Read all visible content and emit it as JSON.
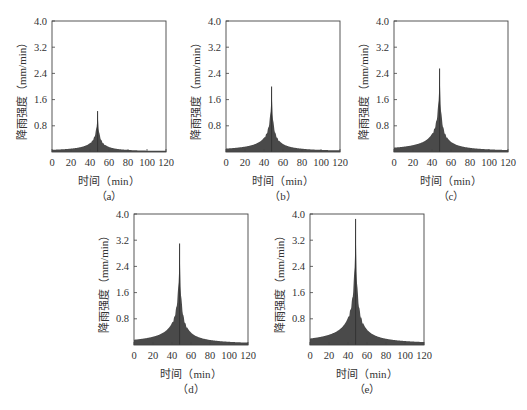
{
  "figure": {
    "ylabel": "降雨强度（mm/min）",
    "xlabel": "时间（min）"
  },
  "chart_data": [
    {
      "type": "area",
      "caption": "（a）",
      "title": "",
      "xlabel": "时间（min）",
      "ylabel": "降雨强度（mm/min）",
      "xlim": [
        0,
        120
      ],
      "ylim": [
        0,
        4.0
      ],
      "xticks": [
        0,
        20,
        40,
        60,
        80,
        100,
        120
      ],
      "yticks": [
        0.8,
        1.6,
        2.4,
        3.2,
        4.0
      ],
      "ytick_labels": [
        "0.8",
        "1.6",
        "2.4",
        "3.2",
        "4.0"
      ],
      "peak_time": 48,
      "peak_value": 1.25,
      "start_value": 0.05,
      "end_value": 0.04,
      "x": [
        0,
        10,
        20,
        30,
        40,
        44,
        46,
        48,
        50,
        52,
        56,
        60,
        70,
        80,
        90,
        100,
        110,
        120
      ],
      "values": [
        0.05,
        0.08,
        0.12,
        0.2,
        0.38,
        0.55,
        0.75,
        1.25,
        0.8,
        0.6,
        0.42,
        0.32,
        0.2,
        0.13,
        0.09,
        0.07,
        0.05,
        0.04
      ],
      "fill_color": "#4a4a4a",
      "grid": false
    },
    {
      "type": "area",
      "caption": "（b）",
      "title": "",
      "xlabel": "时间（min）",
      "ylabel": "降雨强度（mm/min）",
      "xlim": [
        0,
        120
      ],
      "ylim": [
        0,
        4.0
      ],
      "xticks": [
        0,
        20,
        40,
        60,
        80,
        100,
        120
      ],
      "yticks": [
        0.8,
        1.6,
        2.4,
        3.2,
        4.0
      ],
      "ytick_labels": [
        "0.8",
        "1.6",
        "2.4",
        "3.2",
        "4.0"
      ],
      "peak_time": 48,
      "peak_value": 2.0,
      "start_value": 0.06,
      "end_value": 0.05,
      "x": [
        0,
        10,
        20,
        30,
        40,
        44,
        46,
        48,
        50,
        52,
        56,
        60,
        70,
        80,
        90,
        100,
        110,
        120
      ],
      "values": [
        0.06,
        0.1,
        0.16,
        0.28,
        0.55,
        0.85,
        1.2,
        2.0,
        1.25,
        0.9,
        0.6,
        0.45,
        0.27,
        0.17,
        0.12,
        0.09,
        0.07,
        0.05
      ],
      "fill_color": "#4a4a4a",
      "grid": false
    },
    {
      "type": "area",
      "caption": "（c）",
      "title": "",
      "xlabel": "时间（min）",
      "ylabel": "降雨强度（mm/min）",
      "xlim": [
        0,
        120
      ],
      "ylim": [
        0,
        4.0
      ],
      "xticks": [
        0,
        20,
        40,
        60,
        80,
        100,
        120
      ],
      "yticks": [
        0.8,
        1.6,
        2.4,
        3.2,
        4.0
      ],
      "ytick_labels": [
        "0.8",
        "1.6",
        "2.4",
        "3.2",
        "4.0"
      ],
      "peak_time": 48,
      "peak_value": 2.55,
      "start_value": 0.07,
      "end_value": 0.05,
      "x": [
        0,
        10,
        20,
        30,
        40,
        44,
        46,
        48,
        50,
        52,
        56,
        60,
        70,
        80,
        90,
        100,
        110,
        120
      ],
      "values": [
        0.07,
        0.11,
        0.19,
        0.34,
        0.68,
        1.05,
        1.5,
        2.55,
        1.6,
        1.15,
        0.75,
        0.55,
        0.32,
        0.2,
        0.14,
        0.1,
        0.07,
        0.05
      ],
      "fill_color": "#4a4a4a",
      "grid": false
    },
    {
      "type": "area",
      "caption": "（d）",
      "title": "",
      "xlabel": "时间（min）",
      "ylabel": "降雨强度（mm/min）",
      "xlim": [
        0,
        120
      ],
      "ylim": [
        0,
        4.0
      ],
      "xticks": [
        0,
        20,
        40,
        60,
        80,
        100,
        120
      ],
      "yticks": [
        0.8,
        1.6,
        2.4,
        3.2,
        4.0
      ],
      "ytick_labels": [
        "0.8",
        "1.6",
        "2.4",
        "3.2",
        "4.0"
      ],
      "peak_time": 48,
      "peak_value": 3.1,
      "start_value": 0.08,
      "end_value": 0.06,
      "x": [
        0,
        10,
        20,
        30,
        40,
        44,
        46,
        48,
        50,
        52,
        56,
        60,
        70,
        80,
        90,
        100,
        110,
        120
      ],
      "values": [
        0.08,
        0.13,
        0.22,
        0.4,
        0.8,
        1.25,
        1.8,
        3.1,
        1.95,
        1.4,
        0.9,
        0.65,
        0.38,
        0.24,
        0.16,
        0.11,
        0.08,
        0.06
      ],
      "fill_color": "#4a4a4a",
      "grid": false
    },
    {
      "type": "area",
      "caption": "（e）",
      "title": "",
      "xlabel": "时间（min）",
      "ylabel": "降雨强度（mm/min）",
      "xlim": [
        0,
        120
      ],
      "ylim": [
        0,
        4.0
      ],
      "xticks": [
        0,
        20,
        40,
        60,
        80,
        100,
        120
      ],
      "yticks": [
        0.8,
        1.6,
        2.4,
        3.2,
        4.0
      ],
      "ytick_labels": [
        "0.8",
        "1.6",
        "2.4",
        "3.2",
        "4.0"
      ],
      "peak_time": 48,
      "peak_value": 3.85,
      "start_value": 0.09,
      "end_value": 0.07,
      "x": [
        0,
        10,
        20,
        30,
        40,
        44,
        46,
        48,
        50,
        52,
        56,
        60,
        70,
        80,
        90,
        100,
        110,
        120
      ],
      "values": [
        0.09,
        0.15,
        0.26,
        0.48,
        0.95,
        1.5,
        2.2,
        3.85,
        2.35,
        1.7,
        1.1,
        0.78,
        0.45,
        0.28,
        0.19,
        0.13,
        0.09,
        0.07
      ],
      "fill_color": "#4a4a4a",
      "grid": false
    }
  ]
}
